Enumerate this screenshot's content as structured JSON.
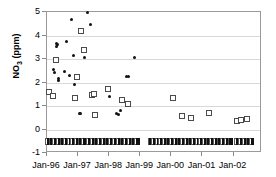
{
  "chart_data": {
    "type": "scatter",
    "title": "",
    "xlabel": "",
    "ylabel": "NO3 (ppm)",
    "ylabel_base": "NO",
    "ylabel_sub": "3",
    "ylabel_units": " (ppm)",
    "ylim": [
      -1,
      5
    ],
    "yticks": [
      5,
      4,
      3,
      2,
      1,
      0,
      -1
    ],
    "xticks": [
      "Jan-96",
      "Jan-97",
      "Jan-98",
      "Jan-99",
      "Jan-00",
      "Jan-01",
      "Jan-02"
    ],
    "xlim_labels": [
      "Jan-96",
      "Jan-02"
    ],
    "grid": true,
    "legend": "none",
    "series": [
      {
        "name": "filled-circle-series",
        "marker": "filled circle",
        "color": "#111111",
        "points": [
          [
            1996.05,
            1.55
          ],
          [
            1996.08,
            1.52
          ],
          [
            1996.22,
            2.55
          ],
          [
            1996.25,
            2.42
          ],
          [
            1996.3,
            3.55
          ],
          [
            1996.32,
            3.68
          ],
          [
            1996.33,
            3.62
          ],
          [
            1996.36,
            2.1
          ],
          [
            1996.38,
            2.16
          ],
          [
            1996.55,
            2.45
          ],
          [
            1996.62,
            3.75
          ],
          [
            1996.72,
            2.3
          ],
          [
            1996.8,
            4.66
          ],
          [
            1996.86,
            3.14
          ],
          [
            1996.9,
            1.9
          ],
          [
            1997.05,
            0.68
          ],
          [
            1997.08,
            0.7
          ],
          [
            1997.2,
            3.07
          ],
          [
            1997.3,
            4.97
          ],
          [
            1997.4,
            4.45
          ],
          [
            1997.55,
            0.66
          ],
          [
            1997.6,
            0.62
          ],
          [
            1998.0,
            1.4
          ],
          [
            1998.25,
            0.68
          ],
          [
            1998.3,
            0.64
          ],
          [
            1998.38,
            0.8
          ],
          [
            1998.55,
            2.25
          ],
          [
            1998.62,
            2.26
          ],
          [
            1998.8,
            3.05
          ],
          [
            2002.2,
            0.44
          ],
          [
            2002.35,
            0.45
          ],
          [
            2002.42,
            0.46
          ]
        ]
      },
      {
        "name": "open-square-series",
        "marker": "open square",
        "color": "#4a4a4a",
        "points": [
          [
            1996.05,
            1.58
          ],
          [
            1996.18,
            1.44
          ],
          [
            1996.28,
            2.95
          ],
          [
            1996.9,
            1.33
          ],
          [
            1996.95,
            2.22
          ],
          [
            1997.08,
            4.2
          ],
          [
            1997.2,
            3.38
          ],
          [
            1997.45,
            1.45
          ],
          [
            1997.5,
            1.5
          ],
          [
            1997.55,
            0.62
          ],
          [
            1997.95,
            1.72
          ],
          [
            1998.4,
            1.25
          ],
          [
            1998.6,
            1.1
          ],
          [
            2000.05,
            1.36
          ],
          [
            2000.35,
            0.56
          ],
          [
            2000.62,
            0.51
          ],
          [
            2001.2,
            0.71
          ],
          [
            2002.1,
            0.37
          ],
          [
            2002.25,
            0.42
          ],
          [
            2002.45,
            0.45
          ]
        ]
      },
      {
        "name": "baseline-detection-row",
        "marker": "mixed dense row",
        "value": -0.5,
        "description": "dense strip of filled and open markers at -0.5"
      }
    ]
  },
  "axes": {
    "y_title_text": "NO",
    "y_title_sub": "3",
    "y_title_unit": " (ppm)"
  }
}
